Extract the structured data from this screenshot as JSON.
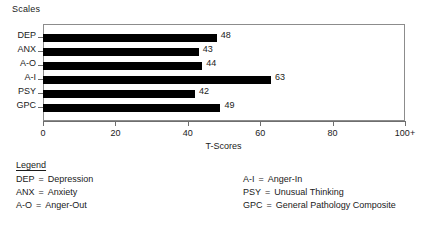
{
  "chart_data": {
    "type": "bar",
    "orientation": "horizontal",
    "title": "Scales",
    "xlabel": "T-Scores",
    "ylabel": "",
    "categories": [
      "DEP",
      "ANX",
      "A-O",
      "A-I",
      "PSY",
      "GPC"
    ],
    "values": [
      48,
      43,
      44,
      63,
      42,
      49
    ],
    "xlim": [
      0,
      100
    ],
    "xticks": [
      0,
      20,
      40,
      60,
      80,
      100
    ],
    "xticklabels": [
      "0",
      "20",
      "40",
      "60",
      "80",
      "100+"
    ],
    "grid": false,
    "legend_position": "below-axes",
    "bar_color": "#000000",
    "frame_color": "#8c8c8c"
  },
  "legend": {
    "title": "Legend",
    "left_column": [
      {
        "abbr": "DEP",
        "eq": "=",
        "desc": "Depression"
      },
      {
        "abbr": "ANX",
        "eq": "=",
        "desc": "Anxiety"
      },
      {
        "abbr": "A-O",
        "eq": "=",
        "desc": "Anger-Out"
      }
    ],
    "right_column": [
      {
        "abbr": "A-I",
        "eq": "=",
        "desc": "Anger-In"
      },
      {
        "abbr": "PSY",
        "eq": "=",
        "desc": "Unusual Thinking"
      },
      {
        "abbr": "GPC",
        "eq": "=",
        "desc": "General Pathology Composite"
      }
    ]
  }
}
